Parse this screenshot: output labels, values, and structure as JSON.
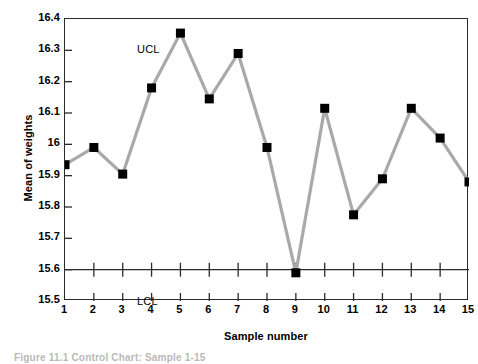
{
  "chart_data": {
    "type": "line",
    "title": "",
    "xlabel": "Sample number",
    "ylabel": "Mean of weights",
    "x": [
      1,
      2,
      3,
      4,
      5,
      6,
      7,
      8,
      9,
      10,
      11,
      12,
      13,
      14,
      15
    ],
    "values": [
      15.935,
      15.99,
      15.905,
      16.18,
      16.355,
      16.145,
      16.29,
      15.99,
      15.59,
      16.115,
      15.775,
      15.89,
      16.115,
      16.02,
      15.88
    ],
    "series": [
      {
        "name": "Mean of weights",
        "values": [
          15.935,
          15.99,
          15.905,
          16.18,
          16.355,
          16.145,
          16.29,
          15.99,
          15.59,
          16.115,
          15.775,
          15.89,
          16.115,
          16.02,
          15.88
        ]
      }
    ],
    "xlim": [
      1,
      15
    ],
    "ylim": [
      15.5,
      16.4
    ],
    "xticks": [
      1,
      2,
      3,
      4,
      5,
      6,
      7,
      8,
      9,
      10,
      11,
      12,
      13,
      14,
      15
    ],
    "xticklabels": [
      "1",
      "2",
      "3",
      "4",
      "5",
      "6",
      "7",
      "8",
      "9",
      "10",
      "11",
      "12",
      "13",
      "14",
      "15"
    ],
    "yticks": [
      15.5,
      15.6,
      15.7,
      15.8,
      15.9,
      16.0,
      16.1,
      16.2,
      16.3,
      16.4
    ],
    "yticklabels": [
      "15.5",
      "15.6",
      "15.7",
      "15.8",
      "15.9",
      "16",
      "16.1",
      "16.2",
      "16.3",
      "16.4"
    ],
    "grid": false,
    "legend": "none",
    "line_color": "#a9a9a9",
    "marker_color": "#000000",
    "marker": "square",
    "annotations": [
      {
        "name": "UCL",
        "label": "UCL",
        "value": 16.4,
        "kind": "upper-control-limit"
      },
      {
        "name": "LCL",
        "label": "LCL",
        "value": 15.6,
        "kind": "lower-control-limit"
      }
    ],
    "out_of_control_points": [
      9
    ]
  },
  "axes": {
    "y_title": "Mean of weights",
    "x_title": "Sample number"
  },
  "limits": {
    "ucl_label": "UCL",
    "lcl_label": "LCL"
  },
  "caption": {
    "text": "Figure 11.1  Control Chart: Sample 1-15"
  }
}
